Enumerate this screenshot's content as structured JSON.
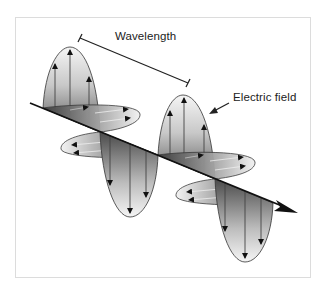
{
  "figure": {
    "labels": {
      "wavelength": "Wavelength",
      "electric_field": "Electric field"
    },
    "colors": {
      "line": "#1a1a1a",
      "frame": "#dcdcdc",
      "lobe_dark": "#555555",
      "lobe_light": "#f4f4f4"
    },
    "components": {
      "propagation_axis": "arrow",
      "electric_field_lobes": 4,
      "magnetic_field_lobes": 4
    }
  }
}
